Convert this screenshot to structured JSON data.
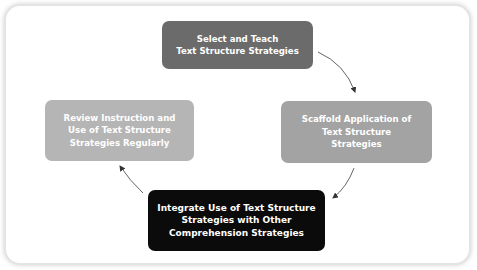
{
  "diagram": {
    "type": "cycle",
    "steps": [
      {
        "id": "select-teach",
        "label": "Select and Teach\nText Structure Strategies",
        "color": "#6b6b6b"
      },
      {
        "id": "scaffold",
        "label": "Scaffold Application of\nText Structure\nStrategies",
        "color": "#a3a3a3"
      },
      {
        "id": "integrate",
        "label": "Integrate Use of Text Structure\nStrategies with Other\nComprehension Strategies",
        "color": "#0b0b0b"
      },
      {
        "id": "review",
        "label": "Review Instruction and\nUse of Text Structure\nStrategies Regularly",
        "color": "#b5b5b5"
      }
    ],
    "arrow_color": "#555555"
  }
}
